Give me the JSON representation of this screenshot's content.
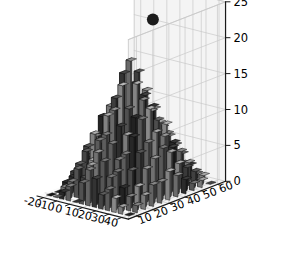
{
  "figure": {
    "background_color": "#ffffff",
    "panel_color": "#f4f4f4",
    "grid_color": "#c9c9c9",
    "axis_line_color": "#1a1a1a",
    "tick_label_color": "#000000"
  },
  "axes": {
    "x": {
      "label": "",
      "ticks": [
        "-20",
        "-10",
        "0",
        "10",
        "20",
        "30",
        "40"
      ],
      "range": [
        -25,
        45
      ]
    },
    "y": {
      "label": "",
      "ticks": [
        "10",
        "20",
        "30",
        "40",
        "50",
        "60"
      ],
      "range": [
        5,
        65
      ]
    },
    "z": {
      "label": "",
      "ticks": [
        "0",
        "5",
        "10",
        "15",
        "20",
        "25"
      ],
      "range": [
        0,
        25
      ]
    }
  },
  "marker": {
    "name": "scatter-point",
    "color": "#1c1c1c",
    "radius_px": 6,
    "x": -2,
    "y": 58,
    "z": 21
  },
  "chart_data": {
    "type": "bar",
    "title": "",
    "subtitle": "",
    "xlabel": "",
    "ylabel": "",
    "zlabel": "",
    "projection": "3d",
    "grid": true,
    "legend": null,
    "colormap": "grayscale",
    "xlim": [
      -25,
      45
    ],
    "ylim": [
      5,
      65
    ],
    "zlim": [
      0,
      25
    ],
    "x_categories": [
      -20,
      -15,
      -10,
      -5,
      0,
      5,
      10,
      15,
      20,
      25,
      30,
      35,
      40
    ],
    "y_categories": [
      10,
      15,
      20,
      25,
      30,
      35,
      40,
      45,
      50,
      55,
      60
    ],
    "note": "values[row] corresponds to y_categories[row]; each row lists bar heights across x_categories",
    "values": [
      [
        0,
        0,
        1,
        2,
        0,
        3,
        5,
        4,
        2,
        3,
        2,
        1,
        0
      ],
      [
        0,
        1,
        2,
        4,
        3,
        5,
        7,
        6,
        4,
        5,
        3,
        2,
        1
      ],
      [
        1,
        2,
        4,
        6,
        5,
        8,
        9,
        8,
        6,
        7,
        5,
        3,
        2
      ],
      [
        2,
        3,
        6,
        8,
        7,
        11,
        12,
        10,
        9,
        9,
        7,
        5,
        3
      ],
      [
        2,
        4,
        7,
        10,
        9,
        13,
        15,
        12,
        11,
        11,
        8,
        6,
        3
      ],
      [
        3,
        5,
        8,
        11,
        12,
        16,
        18,
        15,
        13,
        12,
        9,
        7,
        4
      ],
      [
        2,
        4,
        7,
        10,
        10,
        14,
        16,
        13,
        11,
        10,
        8,
        6,
        3
      ],
      [
        2,
        3,
        6,
        8,
        8,
        11,
        13,
        11,
        9,
        9,
        6,
        4,
        2
      ],
      [
        1,
        2,
        4,
        6,
        6,
        8,
        10,
        8,
        7,
        6,
        5,
        3,
        1
      ],
      [
        0,
        1,
        3,
        4,
        4,
        6,
        7,
        6,
        5,
        4,
        3,
        2,
        1
      ],
      [
        0,
        0,
        1,
        2,
        2,
        3,
        4,
        3,
        2,
        2,
        1,
        1,
        0
      ]
    ]
  }
}
